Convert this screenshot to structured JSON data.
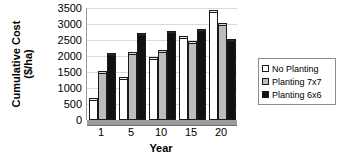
{
  "chart_data": {
    "type": "bar",
    "title": "",
    "xlabel": "Year",
    "ylabel": "Cumulative Cost ($/ha)",
    "ylabel_line1": "Cumulative Cost",
    "ylabel_line2": "($/ha)",
    "categories": [
      "1",
      "5",
      "10",
      "15",
      "20"
    ],
    "yticks": [
      0,
      500,
      1000,
      1500,
      2000,
      2500,
      3000,
      3500
    ],
    "ytick_labels": [
      "0",
      "500",
      "1000",
      "1500",
      "2000",
      "2500",
      "3000",
      "3500"
    ],
    "ylim": [
      0,
      3500
    ],
    "grid": true,
    "legend_position": "right",
    "series": [
      {
        "name": "No Planting",
        "color": "#ffffff",
        "values": [
          650,
          1300,
          1950,
          2600,
          3400
        ]
      },
      {
        "name": "Planting 7x7",
        "color": "#bdbdbd",
        "values": [
          1500,
          2100,
          2150,
          2450,
          3000
        ]
      },
      {
        "name": "Planting 6x6",
        "color": "#111111",
        "values": [
          2050,
          2700,
          2750,
          2800,
          2500
        ]
      }
    ]
  },
  "legend": {
    "items": [
      {
        "label": "No Planting"
      },
      {
        "label": "Planting 7x7"
      },
      {
        "label": "Planting 6x6"
      }
    ]
  }
}
